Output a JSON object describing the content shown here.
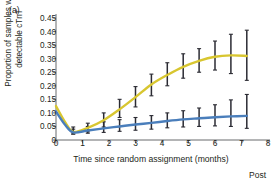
{
  "figure": {
    "panel_label": "(a)",
    "post_label": "Post"
  },
  "chart_data": {
    "type": "line",
    "title": "",
    "xlabel": "Time since random assignment (months)",
    "ylabel": "Proportion of samples with detectable cTnT",
    "xlim": [
      0,
      8
    ],
    "ylim": [
      0,
      0.45
    ],
    "grid": false,
    "legend": "none",
    "xticks": [
      0,
      1,
      2,
      3,
      4,
      5,
      6,
      7,
      8
    ],
    "xticklabels": [
      "0",
      "1",
      "2",
      "3",
      "4",
      "5",
      "6",
      "7",
      "8"
    ],
    "yticks": [
      0,
      0.05,
      0.1,
      0.15,
      0.2,
      0.25,
      0.3,
      0.35,
      0.4,
      0.45
    ],
    "yticklabels": [
      "0",
      "0.05",
      "0.10",
      "0.15",
      "0.20",
      "0.25",
      "0.30",
      "0.35",
      "0.40",
      "0.45"
    ],
    "annotations": [
      "(a)",
      "Post"
    ],
    "colors": {
      "series_1": "#d8c630",
      "series_2": "#4a7ebb",
      "errorbar": "#2b2b33",
      "axis": "#58595b",
      "text": "#231f20"
    },
    "series": [
      {
        "name": "series-yellow",
        "color": "#d8c630",
        "x": [
          0.0,
          0.35,
          0.65,
          1.2,
          1.8,
          2.4,
          3.0,
          3.6,
          4.2,
          4.8,
          5.4,
          6.0,
          6.6,
          7.2
        ],
        "values": [
          0.125,
          0.065,
          0.03,
          0.045,
          0.073,
          0.113,
          0.158,
          0.205,
          0.24,
          0.27,
          0.292,
          0.307,
          0.312,
          0.31
        ],
        "errorbars": {
          "x": [
            0.65,
            1.2,
            1.8,
            2.4,
            3.0,
            3.6,
            4.2,
            4.8,
            5.4,
            6.0,
            6.6,
            7.2
          ],
          "y": [
            0.03,
            0.045,
            0.073,
            0.113,
            0.158,
            0.205,
            0.24,
            0.27,
            0.292,
            0.307,
            0.312,
            0.31
          ],
          "lower": [
            0.022,
            0.03,
            0.048,
            0.083,
            0.122,
            0.163,
            0.2,
            0.228,
            0.25,
            0.258,
            0.245,
            0.22
          ],
          "upper": [
            0.048,
            0.062,
            0.1,
            0.15,
            0.197,
            0.243,
            0.285,
            0.318,
            0.337,
            0.365,
            0.39,
            0.405
          ]
        }
      },
      {
        "name": "series-blue",
        "color": "#4a7ebb",
        "x": [
          0.0,
          0.35,
          0.65,
          1.2,
          1.8,
          2.4,
          3.0,
          3.6,
          4.2,
          4.8,
          5.4,
          6.0,
          6.6,
          7.2
        ],
        "values": [
          0.105,
          0.055,
          0.028,
          0.035,
          0.043,
          0.05,
          0.057,
          0.063,
          0.07,
          0.076,
          0.08,
          0.084,
          0.087,
          0.089
        ],
        "errorbars": {
          "x": [
            0.65,
            1.2,
            1.8,
            2.4,
            3.0,
            3.6,
            4.2,
            4.8,
            5.4,
            6.0,
            6.6,
            7.2
          ],
          "y": [
            0.028,
            0.035,
            0.043,
            0.05,
            0.057,
            0.063,
            0.07,
            0.076,
            0.08,
            0.084,
            0.087,
            0.089
          ],
          "lower": [
            0.022,
            0.025,
            0.028,
            0.032,
            0.036,
            0.04,
            0.045,
            0.048,
            0.05,
            0.052,
            0.05,
            0.043
          ],
          "upper": [
            0.04,
            0.05,
            0.067,
            0.075,
            0.083,
            0.09,
            0.1,
            0.108,
            0.118,
            0.13,
            0.148,
            0.168
          ]
        }
      }
    ]
  }
}
